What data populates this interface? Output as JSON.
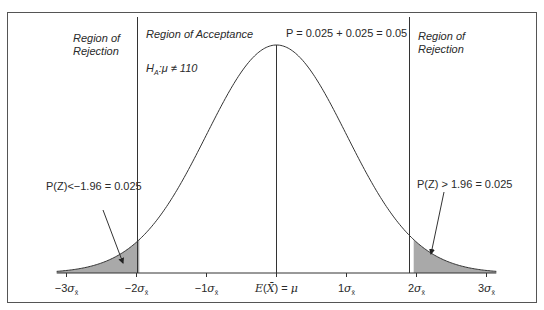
{
  "chart_data": {
    "type": "area",
    "title": "",
    "xlabel": "",
    "ylabel": "",
    "x_ticks": [
      "-3σx̄",
      "-2σx̄",
      "-1σx̄",
      "E(X̄) = μ",
      "1σx̄",
      "2σx̄",
      "3σx̄"
    ],
    "x_tick_values": [
      -3,
      -2,
      -1,
      0,
      1,
      2,
      3
    ],
    "xlim": [
      -3.14,
      3.14
    ],
    "critical_values": [
      -1.96,
      1.96
    ],
    "shaded_regions": [
      {
        "from": -3.14,
        "to": -1.96,
        "area": 0.025,
        "label": "P(Z)<−1.96 = 0.025"
      },
      {
        "from": 1.96,
        "to": 3.14,
        "area": 0.025,
        "label": "P(Z) > 1.96 = 0.025"
      }
    ],
    "total_rejection_probability": "P = 0.025 + 0.025 = 0.05",
    "regions": [
      {
        "name": "Region of Rejection",
        "side": "left"
      },
      {
        "name": "Region of Acceptance",
        "side": "center"
      },
      {
        "name": "Region of Rejection",
        "side": "right"
      }
    ],
    "hypothesis": "H_A: μ ≠ 110",
    "grid": false,
    "legend": "none"
  },
  "labels": {
    "rejection_left_line1": "Region of",
    "rejection_left_line2": "Rejection",
    "acceptance": "Region of Acceptance",
    "hypothesis_H": "H",
    "hypothesis_sub": "A",
    "hypothesis_rest": ":μ ≠ 110",
    "total_p": "P = 0.025 + 0.025 = 0.05",
    "rejection_right_line1": "Region of",
    "rejection_right_line2": "Rejection",
    "left_tail": "P(Z)<−1.96 = 0.025",
    "right_tail": "P(Z) > 1.96 = 0.025"
  },
  "ticks": [
    {
      "prefix": "−3",
      "sym": "σ",
      "sub": "x̄"
    },
    {
      "prefix": "−2",
      "sym": "σ",
      "sub": "x̄"
    },
    {
      "prefix": "−1",
      "sym": "σ",
      "sub": "x̄"
    },
    {
      "prefix": "",
      "sym": "",
      "sub": "",
      "text": "E(X̄) = μ"
    },
    {
      "prefix": "1",
      "sym": "σ",
      "sub": "x̄"
    },
    {
      "prefix": "2",
      "sym": "σ",
      "sub": "x̄"
    },
    {
      "prefix": "3",
      "sym": "σ",
      "sub": "x̄"
    }
  ],
  "colors": {
    "shade": "#a9a9a9",
    "line": "#333333",
    "frame": "#555555"
  }
}
